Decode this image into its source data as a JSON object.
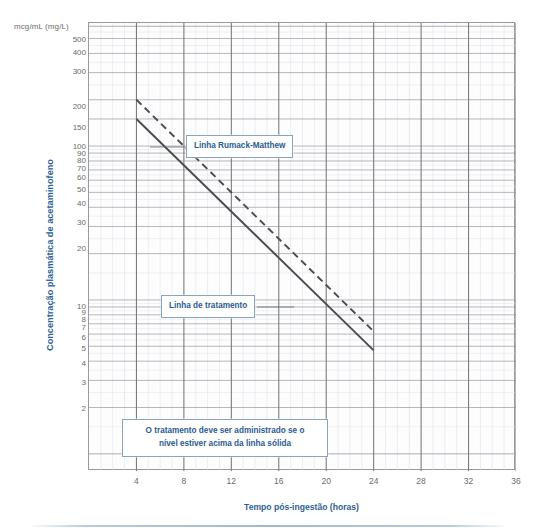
{
  "figure": {
    "units_label": "mcg/mL (mg/L)",
    "y_axis_title": "Concentração plasmática de acetaminofeno",
    "x_axis_title": "Tempo pós-ingestão (horas)"
  },
  "annotations": {
    "rumack_label": "Linha Rumack-Matthew",
    "treatment_label": "Linha de tratamento",
    "note_line1": "O tratamento deve ser administrado se o",
    "note_line2": "nível estiver acima da linha sólida"
  },
  "colors": {
    "accent": "#2a5b90",
    "grid_major": "#8f8f95",
    "grid_minor": "#d9dde4",
    "line": "#4a4a4f",
    "tick_text": "#6b6b6b",
    "rule": "#9fb9d3"
  },
  "chart_data": {
    "type": "line",
    "title": "",
    "xlabel": "Tempo pós-ingestão (horas)",
    "ylabel": "Concentração plasmática de acetaminofeno",
    "yunits": "mcg/mL (mg/L)",
    "xlim": [
      0,
      36
    ],
    "ylim": [
      1,
      600
    ],
    "yscale": "log",
    "xscale": "linear",
    "grid": true,
    "legend": "none (inline callout boxes)",
    "xticks": [
      4,
      8,
      12,
      16,
      20,
      24,
      28,
      32,
      36
    ],
    "xticklabels": [
      "4",
      "8",
      "12",
      "16",
      "20",
      "24",
      "28",
      "32",
      "36"
    ],
    "x_minor_step": 1,
    "yticks": [
      500,
      400,
      300,
      200,
      150,
      100,
      90,
      80,
      70,
      60,
      50,
      40,
      30,
      20,
      10,
      9,
      8,
      7,
      6,
      5,
      4,
      3,
      2
    ],
    "yticklabels": [
      "500",
      "400",
      "300",
      "200",
      "150",
      "100",
      "90",
      "80",
      "70",
      "60",
      "50",
      "40",
      "30",
      "20",
      "10",
      "9",
      "8",
      "7",
      "6",
      "5",
      "4",
      "3",
      "2"
    ],
    "series": [
      {
        "name": "Linha Rumack-Matthew",
        "style": "dashed",
        "x": [
          4,
          24
        ],
        "y": [
          200,
          6.25
        ]
      },
      {
        "name": "Linha de tratamento",
        "style": "solid",
        "x": [
          4,
          24
        ],
        "y": [
          150,
          4.7
        ]
      }
    ],
    "annotations": [
      {
        "text": "Linha Rumack-Matthew",
        "points_to_series": "Linha Rumack-Matthew",
        "at_x": 6.0,
        "at_y": 140
      },
      {
        "text": "Linha de tratamento",
        "points_to_series": "Linha de tratamento",
        "at_x": 17.0,
        "at_y": 16
      },
      {
        "text": "O tratamento deve ser administrado se o nível estiver acima da linha sólida",
        "at_x": 9,
        "at_y": 2.2
      }
    ]
  },
  "yticks_px": {
    "500": 15.5,
    "400": 28.5,
    "300": 48.0,
    "200": 82.5,
    "150": 104.0,
    "100": 123.0,
    "90": 129.5,
    "80": 136.5,
    "70": 144.5,
    "60": 154.0,
    "50": 165.5,
    "40": 180.0,
    "30": 199.0,
    "20": 225.0,
    "10": 282.5,
    "9": 289.0,
    "8": 296.0,
    "7": 304.0,
    "6": 313.5,
    "5": 325.0,
    "4": 339.5,
    "3": 358.5,
    "2": 384.5
  },
  "xticks_px": {
    "4": 47.4,
    "8": 94.9,
    "12": 142.3,
    "16": 189.8,
    "20": 237.2,
    "24": 284.7,
    "28": 332.1,
    "32": 379.6,
    "36": 427.0
  }
}
